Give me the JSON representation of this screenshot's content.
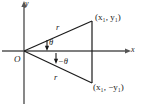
{
  "figure": {
    "type": "geometry-diagram",
    "background_color": "#ffffff",
    "line_color": "#1a1a1a",
    "axes": {
      "x_label": "x",
      "y_label": "y",
      "origin_label": "O"
    },
    "labels": {
      "point_upper": "(x₁, y₁)",
      "point_lower": "(x₁, −y₁)",
      "radius_upper": "r",
      "radius_lower": "r",
      "angle_upper": "θ",
      "angle_lower": "−θ"
    },
    "geometry": {
      "origin_px": [
        24,
        51
      ],
      "point_upper_px": [
        92,
        21
      ],
      "point_lower_px": [
        92,
        83
      ],
      "x_axis_from_px": [
        2,
        51
      ],
      "x_axis_to_px": [
        130,
        51
      ],
      "y_axis_from_px": [
        24,
        4
      ],
      "y_axis_to_px": [
        24,
        104
      ]
    }
  }
}
